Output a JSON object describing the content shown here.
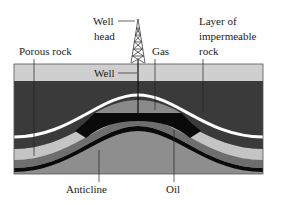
{
  "diagram": {
    "labels": {
      "well_head_line1": "Well",
      "well_head_line2": "head",
      "porous_rock": "Porous rock",
      "gas": "Gas",
      "impermeable_line1": "Layer of",
      "impermeable_line2": "impermeable",
      "impermeable_line3": "rock",
      "well": "Well",
      "anticline": "Anticline",
      "oil": "Oil"
    },
    "colors": {
      "surface_layer": "#cfcfcf",
      "dark_rock": "#3a3a3a",
      "impermeable_stripe": "#ffffff",
      "gas": "#8a8a8a",
      "oil": "#0a0a0a",
      "porous_rock": "#c4c4c4",
      "mid_layer": "#6e6e6e",
      "deep_layer": "#8e8e8e",
      "outline": "#222222"
    }
  }
}
